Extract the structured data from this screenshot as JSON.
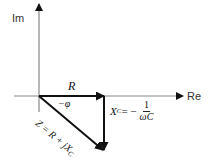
{
  "diagram": {
    "type": "phasor-diagram",
    "axes": {
      "imaginary_label": "Im",
      "real_label": "Re"
    },
    "vectors": [
      {
        "name": "R",
        "label": "R",
        "direction": "along Re axis"
      },
      {
        "name": "X_C",
        "label_lhs": "X",
        "label_sub": "C",
        "label_eq": " = −",
        "frac_num": "1",
        "frac_den": "ωC",
        "direction": "downward (negative Im)"
      },
      {
        "name": "Z",
        "label": "Z = R + jX",
        "label_sub": "C",
        "direction": "diagonal down-right"
      }
    ],
    "angle_label": "−φ",
    "colors": {
      "vector": "#111111",
      "axis": "#888888",
      "background": "#ffffff"
    }
  }
}
